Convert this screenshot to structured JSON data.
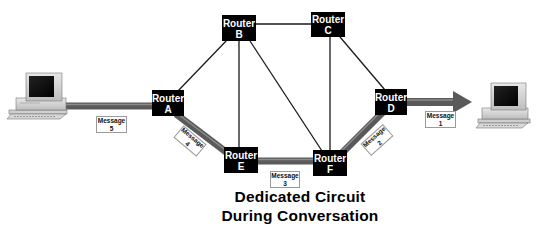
{
  "diagram": {
    "title_line1": "Dedicated Circuit",
    "title_line2": "During Conversation",
    "routers": [
      {
        "id": "A",
        "label": "Router",
        "letter": "A"
      },
      {
        "id": "B",
        "label": "Router",
        "letter": "B"
      },
      {
        "id": "C",
        "label": "Router",
        "letter": "C"
      },
      {
        "id": "D",
        "label": "Router",
        "letter": "D"
      },
      {
        "id": "E",
        "label": "Router",
        "letter": "E"
      },
      {
        "id": "F",
        "label": "Router",
        "letter": "F"
      }
    ],
    "messages": [
      {
        "label": "Message",
        "number": "1"
      },
      {
        "label": "Message",
        "number": "2"
      },
      {
        "label": "Message",
        "number": "3"
      },
      {
        "label": "Message",
        "number": "4"
      },
      {
        "label": "Message",
        "number": "5"
      }
    ],
    "links": [
      [
        "A",
        "B"
      ],
      [
        "B",
        "C"
      ],
      [
        "B",
        "E"
      ],
      [
        "B",
        "F"
      ],
      [
        "C",
        "F"
      ],
      [
        "C",
        "D"
      ]
    ],
    "dedicated_path": [
      "Computer-left",
      "A",
      "E",
      "F",
      "D",
      "Computer-right"
    ],
    "colors": {
      "router_fill": "#000000",
      "router_text": "#ffffff",
      "link": "#1a1a1a",
      "circuit": "#5a5a5a",
      "circuit_highlight": "#8a8a8a"
    },
    "icons": [
      "desktop-computer-icon",
      "desktop-computer-icon"
    ]
  }
}
